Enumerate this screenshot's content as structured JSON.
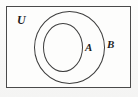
{
  "figure": {
    "kind": "venn-diagram",
    "background_color": "#fbfbfa",
    "line_color": "#3d3d3d",
    "label_color": "#1d1d1d"
  },
  "universe": {
    "label": "U",
    "shape": "rectangle",
    "border_color": "#4a4a4a",
    "fill_color": "#fdfdfc"
  },
  "sets": [
    {
      "label": "B",
      "shape": "circle",
      "relation": "superset",
      "border_color": "#3d3d3d",
      "fill": "none"
    },
    {
      "label": "A",
      "shape": "circle",
      "relation": "subset",
      "border_color": "#3d3d3d",
      "fill": "none"
    }
  ],
  "labels": {
    "universe": "U",
    "outer_set": "B",
    "inner_set": "A"
  }
}
